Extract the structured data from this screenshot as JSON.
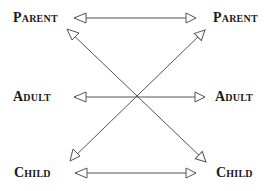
{
  "diagram": {
    "nodes": {
      "left": [
        {
          "id": "parent-left",
          "label": "Parent",
          "x": 13,
          "y": 11
        },
        {
          "id": "adult-left",
          "label": "Adult",
          "x": 13,
          "y": 90
        },
        {
          "id": "child-left",
          "label": "Child",
          "x": 14,
          "y": 166
        }
      ],
      "right": [
        {
          "id": "parent-right",
          "label": "Parent",
          "x": 213,
          "y": 11
        },
        {
          "id": "adult-right",
          "label": "Adult",
          "x": 215,
          "y": 90
        },
        {
          "id": "child-right",
          "label": "Child",
          "x": 216,
          "y": 166
        }
      ]
    },
    "edges": [
      {
        "from": "parent-left",
        "to": "parent-right",
        "type": "bidirectional"
      },
      {
        "from": "adult-left",
        "to": "adult-right",
        "type": "bidirectional"
      },
      {
        "from": "child-left",
        "to": "child-right",
        "type": "bidirectional"
      },
      {
        "from": "parent-left",
        "to": "child-right",
        "type": "bidirectional"
      },
      {
        "from": "child-left",
        "to": "parent-right",
        "type": "bidirectional"
      }
    ],
    "colors": {
      "line": "#555555",
      "text": "#1a1a1a",
      "background": "#ffffff"
    }
  }
}
